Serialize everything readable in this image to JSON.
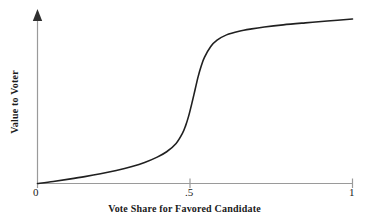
{
  "chart_data": {
    "type": "line",
    "title": "",
    "subtitle": "",
    "xlabel": "Vote Share for Favored Candidate",
    "ylabel": "Value to Voter",
    "xlim": [
      0,
      1
    ],
    "ylim": [
      0,
      1
    ],
    "grid": false,
    "legend": null,
    "xticks": [
      {
        "value": 0,
        "label": "0"
      },
      {
        "value": 0.5,
        "label": ".5"
      },
      {
        "value": 1,
        "label": "1"
      }
    ],
    "yticks": [],
    "annotations": [],
    "series": [
      {
        "name": "Value to Voter",
        "color": "#202020",
        "x": [
          0.0,
          0.05,
          0.1,
          0.15,
          0.2,
          0.25,
          0.3,
          0.34,
          0.38,
          0.41,
          0.44,
          0.46,
          0.47,
          0.48,
          0.49,
          0.5,
          0.51,
          0.52,
          0.53,
          0.55,
          0.57,
          0.6,
          0.64,
          0.68,
          0.72,
          0.78,
          0.85,
          0.92,
          1.0
        ],
        "y": [
          0.0,
          0.012,
          0.026,
          0.041,
          0.058,
          0.078,
          0.102,
          0.126,
          0.158,
          0.19,
          0.24,
          0.3,
          0.345,
          0.405,
          0.48,
          0.56,
          0.64,
          0.705,
          0.755,
          0.82,
          0.858,
          0.89,
          0.912,
          0.926,
          0.937,
          0.95,
          0.962,
          0.973,
          0.985
        ]
      }
    ],
    "axis_style": {
      "axis_color": "#9a9a9a",
      "curve_color": "#202020",
      "background": "#ffffff",
      "y_arrow": true,
      "tick_direction": "down"
    }
  }
}
